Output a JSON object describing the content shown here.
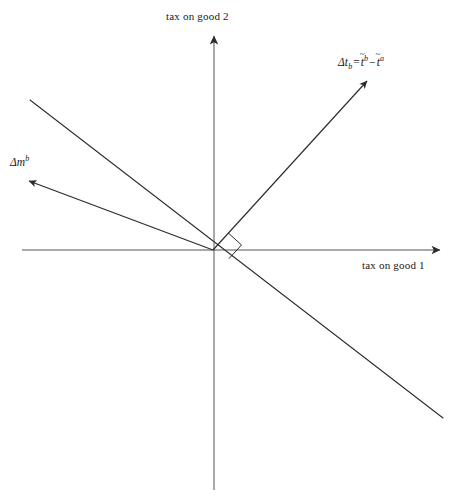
{
  "figure": {
    "background_color": "#ffffff",
    "stroke_color": "#2b2b2b",
    "width": 451,
    "height": 499
  },
  "axes": {
    "y_label": "tax on good 2",
    "x_label": "tax on good 1",
    "origin": {
      "x": 213,
      "y": 250
    },
    "x_axis": {
      "x_start": 22,
      "x_end": 443,
      "y": 250,
      "arrow_at": "end"
    },
    "y_axis": {
      "x": 214,
      "y_start": 490,
      "y_end": 33,
      "arrow_at": "top"
    }
  },
  "vectors": [
    {
      "name": "delta-t-b",
      "label_plain": "Δt_b = t̃^b − t̃^a",
      "label_parts": {
        "delta": "Δ",
        "base": "t",
        "subscript": "b",
        "equals": "=",
        "term1_base": "t",
        "term1_sup": "b",
        "minus": "−",
        "term2_base": "t",
        "term2_sup": "a",
        "accent": "~"
      },
      "from": {
        "x": 213,
        "y": 250
      },
      "to": {
        "x": 370,
        "y": 78
      },
      "arrowhead": true,
      "label_position": {
        "x": 338,
        "y": 55
      }
    },
    {
      "name": "delta-m-b",
      "label_plain": "Δm^b",
      "label_parts": {
        "delta": "Δ",
        "base": "m",
        "superscript": "b"
      },
      "from": {
        "x": 213,
        "y": 250
      },
      "to": {
        "x": 25,
        "y": 180
      },
      "arrowhead": true,
      "label_position": {
        "x": 10,
        "y": 155
      }
    }
  ],
  "lines": [
    {
      "name": "iso-welfare-line",
      "from": {
        "x": 30,
        "y": 100
      },
      "to": {
        "x": 443,
        "y": 418
      },
      "arrowhead": false
    }
  ],
  "markers": [
    {
      "name": "right-angle-marker",
      "type": "right-angle",
      "at": {
        "x": 213,
        "y": 250
      },
      "between": [
        "delta-t-b",
        "iso-welfare-line"
      ]
    }
  ]
}
